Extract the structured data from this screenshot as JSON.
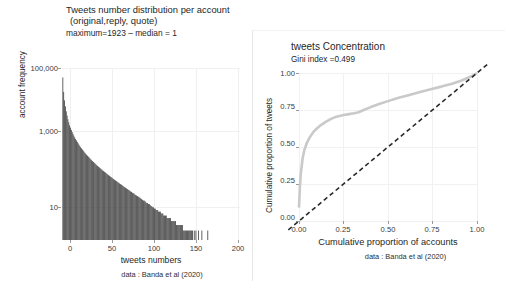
{
  "figure": {
    "background": "#ffffff",
    "caption_text": "data : Banda et al (2020)"
  },
  "left": {
    "title_line1": "Tweets number distribution per account",
    "title_line2": "(original,reply, quote)",
    "subtitle": "maximum=1923 – median = 1",
    "ylabel": "account frequency",
    "xlabel": "tweets numbers",
    "caption": "data : Banda et al (2020)",
    "yticks": [
      "100,000",
      "1,000",
      "10"
    ],
    "xticks": [
      "0",
      "50",
      "100",
      "150",
      "200"
    ]
  },
  "right": {
    "title": "tweets Concentration",
    "subtitle": "Gini index =0.499",
    "ylabel": "Cumulative proportion of tweets",
    "xlabel": "Cumulative proportion of accounts",
    "caption": "data : Banda et al (2020)",
    "yticks": [
      "1.00",
      "0.75",
      "0.50",
      "0.25",
      "0.00"
    ],
    "xticks": [
      "0.00",
      "0.25",
      "0.50",
      "0.75",
      "1.00"
    ]
  },
  "chart_data": [
    {
      "type": "bar",
      "id": "tweets-number-histogram",
      "title": "Tweets number distribution per account (original,reply, quote)",
      "subtitle": "maximum=1923 – median = 1",
      "xlabel": "tweets numbers",
      "ylabel": "account frequency",
      "caption": "data : Banda et al (2020)",
      "xlim": [
        0,
        210
      ],
      "ylim": [
        1,
        300000
      ],
      "yscale": "log",
      "yticks": [
        10,
        1000,
        100000
      ],
      "ytick_labels": [
        "10",
        "1,000",
        "100,000"
      ],
      "xticks": [
        0,
        50,
        100,
        150,
        200
      ],
      "grid": true,
      "bar_color": "#3a3a3a",
      "maximum": 1923,
      "median": 1,
      "x": [
        1,
        2,
        3,
        4,
        5,
        6,
        7,
        8,
        9,
        10,
        11,
        12,
        13,
        14,
        15,
        16,
        17,
        18,
        19,
        20,
        21,
        22,
        23,
        24,
        25,
        26,
        27,
        28,
        29,
        30,
        31,
        32,
        33,
        34,
        35,
        36,
        37,
        38,
        39,
        40,
        41,
        42,
        43,
        44,
        45,
        46,
        47,
        48,
        49,
        50,
        51,
        52,
        53,
        54,
        55,
        56,
        57,
        58,
        59,
        60,
        61,
        62,
        63,
        64,
        65,
        66,
        67,
        68,
        69,
        70,
        71,
        72,
        73,
        74,
        75,
        76,
        77,
        78,
        79,
        80,
        81,
        82,
        83,
        84,
        85,
        86,
        87,
        88,
        89,
        90,
        91,
        92,
        93,
        94,
        95,
        96,
        97,
        98,
        99,
        100,
        101,
        102,
        103,
        104,
        105,
        106,
        107,
        108,
        109,
        110,
        111,
        112,
        113,
        114,
        115,
        116,
        117,
        118,
        119,
        120,
        121,
        122,
        123,
        124,
        125,
        126,
        127,
        128,
        129,
        130,
        131,
        132,
        133,
        134,
        135,
        136,
        137,
        138,
        139,
        140,
        141,
        142,
        143,
        144,
        145,
        146,
        147,
        148,
        149,
        150,
        151,
        152,
        153,
        154,
        155,
        156,
        157,
        158,
        159,
        160,
        161,
        162,
        163,
        164,
        165,
        166,
        167,
        168,
        169,
        170,
        171,
        172,
        173,
        174,
        175,
        176,
        177,
        178,
        179,
        180,
        181,
        182,
        183,
        184,
        185,
        186,
        187,
        188,
        189,
        190,
        191,
        192,
        193,
        194,
        195,
        196,
        197,
        198,
        199,
        200
      ],
      "values": [
        150000,
        52000,
        28000,
        18000,
        12500,
        9200,
        7000,
        5600,
        4500,
        3800,
        3200,
        2750,
        2400,
        2100,
        1850,
        1650,
        1480,
        1330,
        1200,
        1090,
        990,
        905,
        830,
        765,
        705,
        650,
        600,
        560,
        520,
        485,
        452,
        422,
        396,
        370,
        348,
        326,
        307,
        289,
        272,
        257,
        242,
        229,
        216,
        205,
        194,
        184,
        174,
        165,
        157,
        149,
        142,
        135,
        128,
        122,
        116,
        111,
        105,
        100,
        96,
        91,
        87,
        83,
        79,
        76,
        72,
        69,
        66,
        63,
        60,
        58,
        55,
        53,
        50,
        48,
        46,
        44,
        42,
        40,
        39,
        37,
        35,
        34,
        32,
        31,
        30,
        28,
        27,
        26,
        25,
        24,
        23,
        22,
        21,
        20,
        19,
        18,
        18,
        17,
        16,
        15,
        15,
        14,
        14,
        13,
        12,
        12,
        11,
        11,
        10,
        10,
        9,
        9,
        9,
        8,
        8,
        8,
        7,
        7,
        7,
        6,
        6,
        6,
        6,
        5,
        5,
        5,
        5,
        5,
        4,
        4,
        4,
        4,
        4,
        4,
        3,
        3,
        3,
        3,
        3,
        3,
        3,
        3,
        2,
        2,
        2,
        2,
        2,
        2,
        2,
        2,
        2,
        2,
        2,
        2,
        1,
        2,
        1,
        2,
        1,
        1,
        2,
        1,
        1,
        1,
        2,
        1,
        1,
        1,
        1,
        1,
        1,
        2,
        1,
        1,
        1,
        1,
        1,
        1,
        1,
        1,
        1,
        1,
        1,
        1,
        1,
        1,
        1,
        1,
        1,
        1,
        1,
        1,
        1,
        1,
        1,
        1,
        1,
        1,
        1
      ]
    },
    {
      "type": "line",
      "id": "tweets-concentration-lorenz",
      "title": "tweets Concentration",
      "subtitle": "Gini index =0.499",
      "xlabel": "Cumulative proportion of accounts",
      "ylabel": "Cumulative proportion of tweets",
      "caption": "data : Banda et al (2020)",
      "gini_index": 0.499,
      "xlim": [
        0,
        1
      ],
      "ylim": [
        0,
        1
      ],
      "xticks": [
        0.0,
        0.25,
        0.5,
        0.75,
        1.0
      ],
      "yticks": [
        0.0,
        0.25,
        0.5,
        0.75,
        1.0
      ],
      "grid": true,
      "legend": "none",
      "series": [
        {
          "name": "Lorenz curve",
          "color": "#c9c9c9",
          "style": "solid",
          "x": [
            0.0,
            0.005,
            0.01,
            0.02,
            0.03,
            0.045,
            0.06,
            0.08,
            0.1,
            0.125,
            0.15,
            0.18,
            0.21,
            0.245,
            0.28,
            0.31,
            0.335,
            0.36,
            0.4,
            0.45,
            0.5,
            0.56,
            0.62,
            0.68,
            0.74,
            0.8,
            0.86,
            0.91,
            0.95,
            0.975,
            1.0
          ],
          "y": [
            0.09,
            0.23,
            0.32,
            0.42,
            0.48,
            0.53,
            0.565,
            0.6,
            0.625,
            0.65,
            0.67,
            0.69,
            0.705,
            0.715,
            0.722,
            0.728,
            0.735,
            0.748,
            0.768,
            0.79,
            0.81,
            0.832,
            0.852,
            0.872,
            0.89,
            0.908,
            0.928,
            0.948,
            0.968,
            0.982,
            1.0
          ]
        },
        {
          "name": "Line of equality",
          "color": "#2a2a2a",
          "style": "dashed",
          "x": [
            -0.06,
            1.06
          ],
          "y": [
            -0.06,
            1.06
          ]
        }
      ]
    }
  ]
}
